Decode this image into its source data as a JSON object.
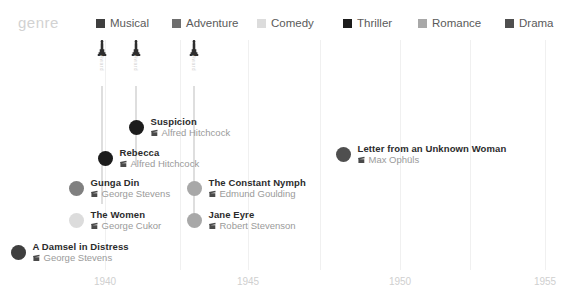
{
  "legend": {
    "title": "genre",
    "items": [
      {
        "label": "Musical",
        "color": "#3f3f3f",
        "x": 96,
        "swatch": "legend-swatch-musical"
      },
      {
        "label": "Adventure",
        "color": "#6e6e6e",
        "x": 172,
        "swatch": "legend-swatch-adventure"
      },
      {
        "label": "Comedy",
        "color": "#dcdcdc",
        "x": 257,
        "swatch": "legend-swatch-comedy"
      },
      {
        "label": "Thriller",
        "color": "#1c1c1c",
        "x": 343,
        "swatch": "legend-swatch-thriller"
      },
      {
        "label": "Romance",
        "color": "#a8a8a8",
        "x": 418,
        "swatch": "legend-swatch-romance"
      },
      {
        "label": "Drama",
        "color": "#4f4f4f",
        "x": 505,
        "swatch": "legend-swatch-drama"
      }
    ]
  },
  "axis": {
    "label": "",
    "ticks": [
      {
        "label": "1940",
        "x": 105
      },
      {
        "label": "1945",
        "x": 248
      },
      {
        "label": "1950",
        "x": 400
      },
      {
        "label": "1955",
        "x": 545
      }
    ],
    "gridlines": [
      105,
      248,
      400,
      545,
      180,
      320,
      470
    ]
  },
  "awards": [
    {
      "icon": "oscar-statuette-icon",
      "text": "Award",
      "x": 102,
      "stem_height": 118
    },
    {
      "icon": "oscar-statuette-icon",
      "text": "Award",
      "x": 136,
      "stem_height": 79
    },
    {
      "icon": "oscar-statuette-icon",
      "text": "Award",
      "x": 194,
      "stem_height": 140
    }
  ],
  "films": [
    {
      "title": "Suspicion",
      "director": "Alfred Hitchcock",
      "genre": "Thriller",
      "color": "#1c1c1c",
      "dot_x": 136,
      "dot_y": 124,
      "year": 1941
    },
    {
      "title": "Rebecca",
      "director": "Alfred Hitchcock",
      "genre": "Thriller",
      "color": "#1c1c1c",
      "dot_x": 105,
      "dot_y": 155,
      "year": 1940
    },
    {
      "title": "Letter from an Unknown Woman",
      "director": "Max Ophüls",
      "genre": "Drama",
      "color": "#4f4f4f",
      "dot_x": 343,
      "dot_y": 151,
      "year": 1948
    },
    {
      "title": "Gunga Din",
      "director": "George Stevens",
      "genre": "Adventure",
      "color": "#808080",
      "dot_x": 76,
      "dot_y": 185,
      "year": 1939
    },
    {
      "title": "The Constant Nymph",
      "director": "Edmund Goulding",
      "genre": "Romance",
      "color": "#a8a8a8",
      "dot_x": 194,
      "dot_y": 185,
      "year": 1943
    },
    {
      "title": "The Women",
      "director": "George Cukor",
      "genre": "Comedy",
      "color": "#dcdcdc",
      "dot_x": 76,
      "dot_y": 217,
      "year": 1939
    },
    {
      "title": "Jane Eyre",
      "director": "Robert Stevenson",
      "genre": "Romance",
      "color": "#a8a8a8",
      "dot_x": 194,
      "dot_y": 217,
      "year": 1943
    },
    {
      "title": "A Damsel in Distress",
      "director": "George Stevens",
      "genre": "Musical",
      "color": "#3f3f3f",
      "dot_x": 18,
      "dot_y": 249,
      "year": 1937
    }
  ],
  "chart_data": {
    "type": "scatter",
    "title": "",
    "xlabel": "",
    "ylabel": "",
    "xlim": [
      1937,
      1956
    ],
    "grid": true,
    "legend_position": "top",
    "legend_title": "genre",
    "legend_entries": [
      "Musical",
      "Adventure",
      "Comedy",
      "Thriller",
      "Romance",
      "Drama"
    ],
    "xticks": [
      1940,
      1945,
      1950,
      1955
    ],
    "points": [
      {
        "label": "A Damsel in Distress",
        "director": "George Stevens",
        "x": 1937,
        "row": 7,
        "genre": "Musical",
        "award": false
      },
      {
        "label": "Gunga Din",
        "director": "George Stevens",
        "x": 1939,
        "row": 4,
        "genre": "Adventure",
        "award": false
      },
      {
        "label": "The Women",
        "director": "George Cukor",
        "x": 1939,
        "row": 6,
        "genre": "Comedy",
        "award": false
      },
      {
        "label": "Rebecca",
        "director": "Alfred Hitchcock",
        "x": 1940,
        "row": 3,
        "genre": "Thriller",
        "award": true
      },
      {
        "label": "Suspicion",
        "director": "Alfred Hitchcock",
        "x": 1941,
        "row": 2,
        "genre": "Thriller",
        "award": true
      },
      {
        "label": "The Constant Nymph",
        "director": "Edmund Goulding",
        "x": 1943,
        "row": 4,
        "genre": "Romance",
        "award": true
      },
      {
        "label": "Jane Eyre",
        "director": "Robert Stevenson",
        "x": 1943,
        "row": 6,
        "genre": "Romance",
        "award": false
      },
      {
        "label": "Letter from an Unknown Woman",
        "director": "Max Ophüls",
        "x": 1948,
        "row": 3,
        "genre": "Drama",
        "award": false
      }
    ]
  }
}
